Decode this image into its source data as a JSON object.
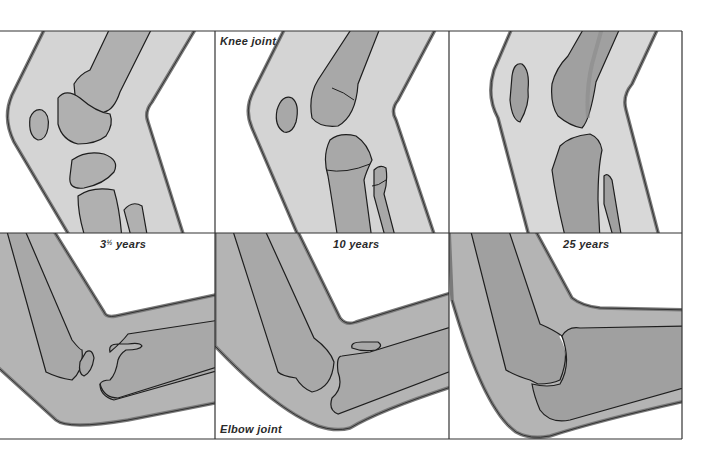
{
  "figure": {
    "layout": {
      "rows": 2,
      "columns": 3
    },
    "row_labels": {
      "knee": "Knee joint",
      "elbow": "Elbow joint"
    },
    "column_labels": [
      {
        "whole": "3",
        "fraction": "½",
        "unit": " years"
      },
      {
        "text": "10 years"
      },
      {
        "text": "25 years"
      }
    ],
    "panels": [
      {
        "row": "knee",
        "age": "3½ years"
      },
      {
        "row": "knee",
        "age": "10 years"
      },
      {
        "row": "knee",
        "age": "25 years"
      },
      {
        "row": "elbow",
        "age": "3½ years"
      },
      {
        "row": "elbow",
        "age": "10 years"
      },
      {
        "row": "elbow",
        "age": "25 years"
      }
    ],
    "colors": {
      "background": "#ffffff",
      "frame": "#333333",
      "soft_tissue": "#d4d4d4",
      "soft_tissue_elbow": "#b4b4b4",
      "bone": "#a8a8a8",
      "bone_dark": "#959595",
      "skin_edge": "#7a7a7a",
      "outline": "#1e1e1e"
    }
  }
}
